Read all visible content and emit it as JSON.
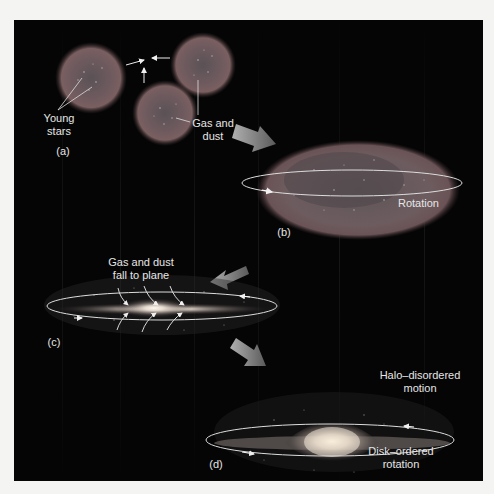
{
  "figure": {
    "panels": [
      {
        "id": "a",
        "label": "(a)",
        "annotations": {
          "young_stars_line1": "Young",
          "young_stars_line2": "stars",
          "gas_dust_line1": "Gas and",
          "gas_dust_line2": "dust"
        }
      },
      {
        "id": "b",
        "label": "(b)",
        "annotations": {
          "rotation": "Rotation"
        }
      },
      {
        "id": "c",
        "label": "(c)",
        "annotations": {
          "fall_line1": "Gas and dust",
          "fall_line2": "fall to plane"
        }
      },
      {
        "id": "d",
        "label": "(d)",
        "annotations": {
          "halo_line1": "Halo–disordered",
          "halo_line2": "motion",
          "disk_line1": "Disk–ordered",
          "disk_line2": "rotation"
        }
      }
    ],
    "colors": {
      "background": "#050505",
      "page": "#f4f4f2",
      "cloud": "#6e5a5e",
      "text": "#e6e6e6",
      "arrow": "#8a8a8a",
      "glow": "#fff6e8"
    }
  }
}
